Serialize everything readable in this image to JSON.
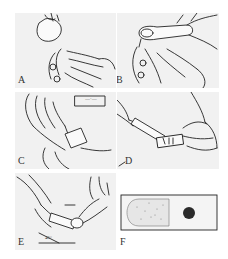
{
  "figure": {
    "panels": [
      {
        "id": "A",
        "label": "A"
      },
      {
        "id": "B",
        "label": "B"
      },
      {
        "id": "C",
        "label": "C",
        "slide_tag": "—·—"
      },
      {
        "id": "D",
        "label": "D"
      },
      {
        "id": "E",
        "label": "E",
        "angle_label": "45°"
      },
      {
        "id": "F",
        "label": "F"
      }
    ],
    "colors": {
      "panel_bg": "#f1f1f1",
      "ink": "#222222",
      "drop": "#2a2a2a",
      "page_bg": "#ffffff"
    }
  }
}
